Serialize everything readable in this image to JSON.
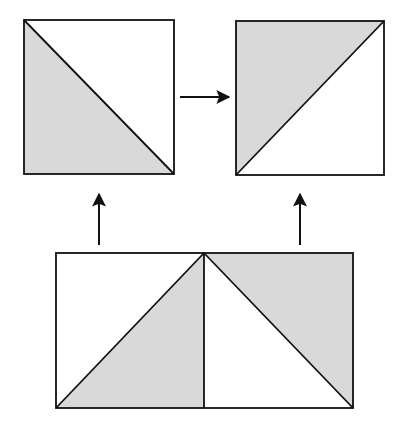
{
  "diagram": {
    "colors": {
      "shade": "#d9d9d9",
      "stroke": "#111111",
      "background": "#ffffff"
    },
    "shapes": {
      "top_left_square": {
        "x": 24,
        "y": 20,
        "w": 150,
        "h": 154,
        "shaded_half": "lower-left"
      },
      "top_right_square": {
        "x": 236,
        "y": 21,
        "w": 148,
        "h": 154,
        "shaded_half": "upper-left"
      },
      "bottom_rectangle": {
        "x": 56,
        "y": 253,
        "w": 297,
        "h": 155,
        "divider_x": 204
      }
    },
    "arrows": [
      {
        "name": "right-arrow",
        "from": [
          180,
          97
        ],
        "to": [
          230,
          97
        ]
      },
      {
        "name": "up-arrow-left",
        "from": [
          99,
          245
        ],
        "to": [
          99,
          193
        ]
      },
      {
        "name": "up-arrow-right",
        "from": [
          300,
          245
        ],
        "to": [
          300,
          193
        ]
      }
    ]
  }
}
